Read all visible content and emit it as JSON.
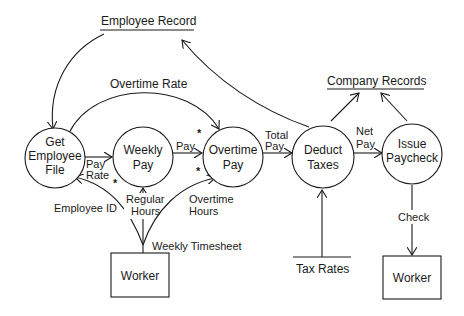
{
  "diagram": {
    "type": "data-flow-diagram",
    "processes": [
      {
        "id": "get_employee_file",
        "line1": "Get",
        "line2": "Employee",
        "line3": "File"
      },
      {
        "id": "weekly_pay",
        "line1": "Weekly",
        "line2": "Pay"
      },
      {
        "id": "overtime_pay",
        "line1": "Overtime",
        "line2": "Pay"
      },
      {
        "id": "deduct_taxes",
        "line1": "Deduct",
        "line2": "Taxes"
      },
      {
        "id": "issue_paycheck",
        "line1": "Issue",
        "line2": "Paycheck"
      }
    ],
    "data_stores": [
      {
        "id": "employee_record",
        "label": "Employee Record"
      },
      {
        "id": "company_records",
        "label": "Company Records"
      },
      {
        "id": "tax_rates",
        "label": "Tax Rates"
      }
    ],
    "external_entities": [
      {
        "id": "worker_source",
        "label": "Worker"
      },
      {
        "id": "worker_sink",
        "label": "Worker"
      }
    ],
    "flows": {
      "overtime_rate": "Overtime Rate",
      "pay_rate_1": "Pay",
      "pay_rate_2": "Rate",
      "pay": "Pay",
      "total_pay_1": "Total",
      "total_pay_2": "Pay",
      "net_pay_1": "Net",
      "net_pay_2": "Pay",
      "employee_id": "Employee ID",
      "regular_hours_1": "Regular",
      "regular_hours_2": "Hours",
      "overtime_hours_1": "Overtime",
      "overtime_hours_2": "Hours",
      "weekly_timesheet": "Weekly Timesheet",
      "check": "Check"
    },
    "markers": {
      "star": "*"
    }
  }
}
